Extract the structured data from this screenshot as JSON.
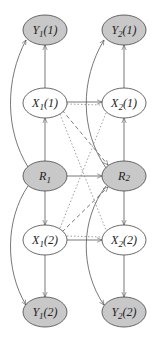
{
  "diagram": {
    "colors": {
      "observed_fill": "#c8c8c8",
      "hidden_fill": "#ffffff",
      "stroke": "#444444"
    },
    "nodes": {
      "y1_1": {
        "base": "Y",
        "sub": "1",
        "arg": "(1)",
        "observed": true
      },
      "y2_1": {
        "base": "Y",
        "sub": "2",
        "arg": "(1)",
        "observed": true
      },
      "x1_1": {
        "base": "X",
        "sub": "1",
        "arg": "(1)",
        "observed": false
      },
      "x2_1": {
        "base": "X",
        "sub": "2",
        "arg": "(1)",
        "observed": false
      },
      "r1": {
        "base": "R",
        "sub": "1",
        "arg": "",
        "observed": true
      },
      "r2": {
        "base": "R",
        "sub": "2",
        "arg": "",
        "observed": true
      },
      "x1_2": {
        "base": "X",
        "sub": "1",
        "arg": "(2)",
        "observed": false
      },
      "x2_2": {
        "base": "X",
        "sub": "2",
        "arg": "(2)",
        "observed": false
      },
      "y1_2": {
        "base": "Y",
        "sub": "1",
        "arg": "(2)",
        "observed": true
      },
      "y2_2": {
        "base": "Y",
        "sub": "2",
        "arg": "(2)",
        "observed": true
      }
    },
    "edges": [
      {
        "from": "x1_1",
        "to": "y1_1",
        "style": "solid"
      },
      {
        "from": "x2_1",
        "to": "y2_1",
        "style": "solid"
      },
      {
        "from": "r1",
        "to": "x1_1",
        "style": "solid"
      },
      {
        "from": "r2",
        "to": "x2_1",
        "style": "solid"
      },
      {
        "from": "r1",
        "to": "x1_2",
        "style": "solid"
      },
      {
        "from": "r2",
        "to": "x2_2",
        "style": "solid"
      },
      {
        "from": "x1_2",
        "to": "y1_2",
        "style": "solid"
      },
      {
        "from": "x2_2",
        "to": "y2_2",
        "style": "solid"
      },
      {
        "from": "x1_1",
        "to": "x2_1",
        "style": "solid"
      },
      {
        "from": "r1",
        "to": "r2",
        "style": "solid"
      },
      {
        "from": "x1_2",
        "to": "x2_2",
        "style": "solid"
      },
      {
        "from": "r1",
        "to": "y1_1",
        "style": "solid-curved"
      },
      {
        "from": "r1",
        "to": "y1_2",
        "style": "solid-curved"
      },
      {
        "from": "r2",
        "to": "y2_1",
        "style": "solid-curved"
      },
      {
        "from": "r2",
        "to": "y2_2",
        "style": "solid-curved"
      },
      {
        "from": "x1_1",
        "to": "r2",
        "style": "dashed"
      },
      {
        "from": "x1_1",
        "to": "x2_2",
        "style": "dotted"
      },
      {
        "from": "x1_2",
        "to": "r2",
        "style": "dashed"
      },
      {
        "from": "x1_2",
        "to": "x2_1",
        "style": "dotted"
      },
      {
        "from": "x1_1",
        "to": "x2_1",
        "style": "dotted"
      },
      {
        "from": "x1_2",
        "to": "x2_2",
        "style": "dotted"
      }
    ]
  }
}
